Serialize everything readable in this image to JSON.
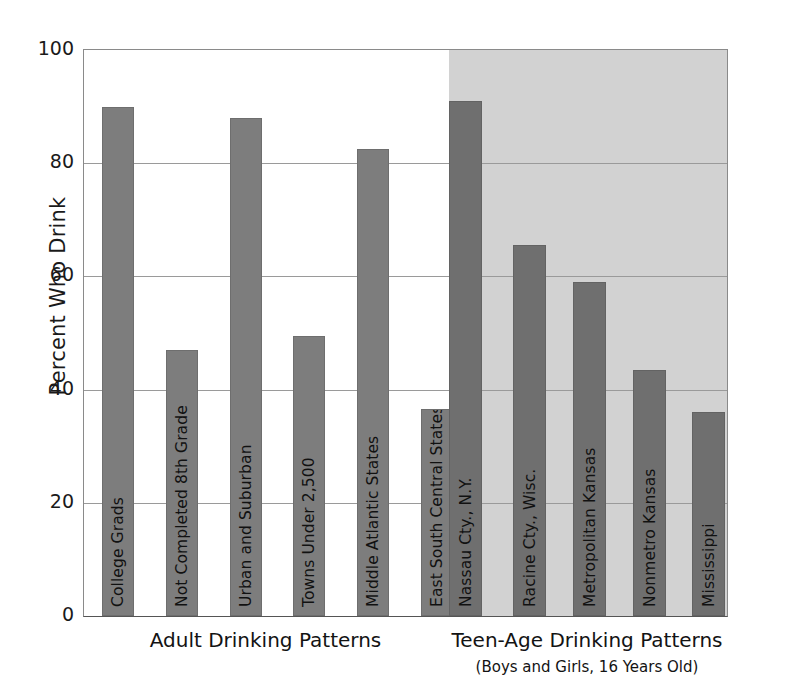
{
  "chart_data": {
    "type": "bar",
    "title": "",
    "xlabel": "",
    "ylabel": "Percent Who Drink",
    "ylim": [
      0,
      100
    ],
    "grid": true,
    "legend": "none",
    "yticks": [
      "0",
      "20",
      "40",
      "60",
      "80",
      "100"
    ],
    "ytick_values": [
      0,
      20,
      40,
      60,
      80,
      100
    ],
    "categories": [
      "College Grads",
      "Not Completed 8th Grade",
      "Urban and Suburban",
      "Towns Under 2,500",
      "Middle Atlantic States",
      "East South Central States",
      "Nassau Cty., N.Y.",
      "Racine Cty., Wisc.",
      "Metropolitan Kansas",
      "Nonmetro Kansas",
      "Mississippi"
    ],
    "values": [
      90,
      47,
      88,
      49.5,
      82.5,
      36.5,
      91,
      65.5,
      59,
      43.5,
      36
    ],
    "groups": [
      {
        "name": "Adult Drinking Patterns",
        "subtitle": "",
        "categories": [
          "College Grads",
          "Not Completed 8th Grade",
          "Urban and Suburban",
          "Towns Under 2,500",
          "Middle Atlantic States",
          "East South Central States"
        ],
        "values": [
          90,
          47,
          88,
          49.5,
          82.5,
          36.5
        ],
        "shaded": false
      },
      {
        "name": "Teen-Age Drinking Patterns",
        "subtitle": "(Boys and Girls, 16 Years Old)",
        "categories": [
          "Nassau Cty., N.Y.",
          "Racine Cty., Wisc.",
          "Metropolitan Kansas",
          "Nonmetro Kansas",
          "Mississippi"
        ],
        "values": [
          91,
          65.5,
          59,
          43.5,
          36
        ],
        "shaded": true
      }
    ],
    "colors": {
      "adult_bar": "#7d7d7d",
      "teen_bar": "#6f6f6f",
      "teen_panel_background": "#d2d2d2",
      "plot_background": "#ffffff",
      "gridline": "#9a9a9a",
      "axis": "#555555",
      "text": "#131313"
    }
  },
  "axis": {
    "y_title": "Percent Who Drink",
    "ticks": [
      {
        "label": "100",
        "value": 100
      },
      {
        "label": "80",
        "value": 80
      },
      {
        "label": "60",
        "value": 60
      },
      {
        "label": "40",
        "value": 40
      },
      {
        "label": "20",
        "value": 20
      },
      {
        "label": "0",
        "value": 0
      }
    ]
  },
  "bars": [
    {
      "label": "College Grads",
      "value": 90,
      "group": "adult"
    },
    {
      "label": "Not Completed 8th Grade",
      "value": 47,
      "group": "adult"
    },
    {
      "label": "Urban and Suburban",
      "value": 88,
      "group": "adult"
    },
    {
      "label": "Towns Under 2,500",
      "value": 49.5,
      "group": "adult"
    },
    {
      "label": "Middle Atlantic States",
      "value": 82.5,
      "group": "adult"
    },
    {
      "label": "East South Central States",
      "value": 36.5,
      "group": "adult"
    },
    {
      "label": "Nassau Cty., N.Y.",
      "value": 91,
      "group": "teen"
    },
    {
      "label": "Racine Cty., Wisc.",
      "value": 65.5,
      "group": "teen"
    },
    {
      "label": "Metropolitan Kansas",
      "value": 59,
      "group": "teen"
    },
    {
      "label": "Nonmetro Kansas",
      "value": 43.5,
      "group": "teen"
    },
    {
      "label": "Mississippi",
      "value": 36,
      "group": "teen"
    }
  ],
  "captions": {
    "adult": "Adult Drinking Patterns",
    "teen": "Teen-Age Drinking Patterns",
    "teen_sub": "(Boys and Girls, 16 Years Old)"
  }
}
